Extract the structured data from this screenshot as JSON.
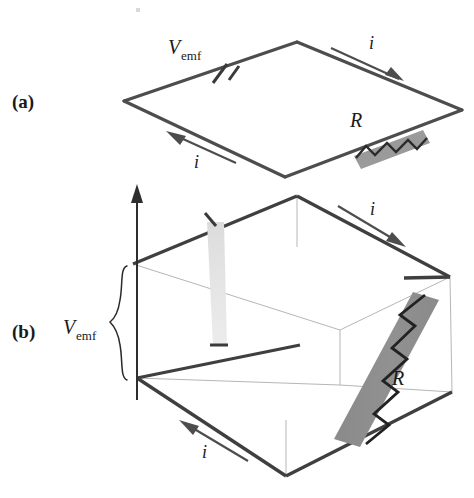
{
  "figure": {
    "type": "physics-circuit-diagram",
    "background_color": "#ffffff",
    "panels": [
      {
        "id": "a",
        "label": "(a)",
        "description": "Flat rectangular circuit loop drawn in perspective as a parallelogram, containing an emf source and a resistor",
        "label_position": {
          "x": 12,
          "y": 108
        },
        "loop_vertices": [
          {
            "name": "left",
            "x": 124,
            "y": 101
          },
          {
            "name": "top",
            "x": 297,
            "y": 42
          },
          {
            "name": "right",
            "x": 462,
            "y": 110
          },
          {
            "name": "bottom",
            "x": 285,
            "y": 177
          }
        ],
        "emf": {
          "label": "V",
          "subscript": "emf",
          "label_x": 168,
          "label_y": 52,
          "symbol": "battery-plates",
          "position": {
            "x": 224,
            "y": 73
          }
        },
        "resistor": {
          "label": "R",
          "label_x": 356,
          "label_y": 126,
          "slab_color": "#9a9a9a",
          "position": {
            "x": 391,
            "y": 141
          }
        },
        "current_arrows": [
          {
            "name": "top-right",
            "label": "i",
            "label_x": 371,
            "label_y": 48,
            "direction": "down-right"
          },
          {
            "name": "bottom-left",
            "label": "i",
            "label_x": 196,
            "label_y": 166,
            "direction": "up-left"
          }
        ]
      },
      {
        "id": "b",
        "label": "(b)",
        "description": "Same circuit redrawn as a three-dimensional box with a vertical potential axis, a brace marking V_emf, a tapered light band for the emf source and a dark slanted slab for the resistor",
        "label_position": {
          "x": 12,
          "y": 338
        },
        "box_vertices": [
          {
            "name": "top-apex",
            "x": 297,
            "y": 196
          },
          {
            "name": "top-left-back",
            "x": 133,
            "y": 264
          },
          {
            "name": "top-right",
            "x": 450,
            "y": 277
          },
          {
            "name": "top-back-hidden",
            "x": 340,
            "y": 330
          },
          {
            "name": "bottom-left-front",
            "x": 137,
            "y": 378
          },
          {
            "name": "bottom-front-apex",
            "x": 286,
            "y": 476
          },
          {
            "name": "bottom-right",
            "x": 452,
            "y": 392
          },
          {
            "name": "bottom-back-hidden",
            "x": 340,
            "y": 385
          }
        ],
        "axis": {
          "name": "potential-axis",
          "x": 137,
          "y_top": 186,
          "y_bottom": 400,
          "arrowhead": "up"
        },
        "brace": {
          "label": "V",
          "subscript": "emf",
          "label_x": 72,
          "label_y": 332,
          "y_top": 266,
          "y_bottom": 380,
          "x": 122
        },
        "emf": {
          "name": "emf-band",
          "color": "#e2e2e2",
          "top_y": 222,
          "bottom_y": 346,
          "description": "tapered light gray vertical band showing the potential rise"
        },
        "resistor": {
          "label": "R",
          "label_x": 399,
          "label_y": 383,
          "slab_color": "#8c8c8c",
          "description": "dark gray slanted slab with zigzag showing the potential drop"
        },
        "current_arrows": [
          {
            "name": "top-right",
            "label": "i",
            "label_x": 372,
            "label_y": 214,
            "direction": "down-right"
          },
          {
            "name": "bottom-left",
            "label": "i",
            "label_x": 204,
            "label_y": 455,
            "direction": "up-left"
          }
        ]
      }
    ],
    "colors": {
      "wire": "#4d4d4d",
      "hidden_edge": "#b6b6b6",
      "resistor_gray_a": "#9a9a9a",
      "resistor_gray_b": "#8c8c8c",
      "emf_band_gray": "#e2e2e2",
      "text": "#1a1a1a"
    }
  }
}
